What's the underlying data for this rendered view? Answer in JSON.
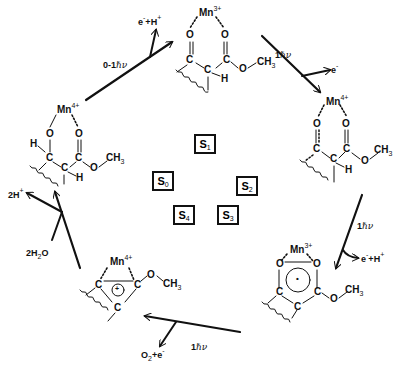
{
  "diagram": {
    "type": "cycle",
    "center_states": [
      {
        "id": "S1",
        "letter": "S",
        "index": "1"
      },
      {
        "id": "S0",
        "letter": "S",
        "index": "0"
      },
      {
        "id": "S2",
        "letter": "S",
        "index": "2"
      },
      {
        "id": "S4",
        "letter": "S",
        "index": "4"
      },
      {
        "id": "S3",
        "letter": "S",
        "index": "3"
      }
    ],
    "structures": {
      "top": {
        "mn": "Mn",
        "charge": "3+",
        "atoms": [
          "O",
          "O",
          "C",
          "C",
          "C",
          "H",
          "O",
          "CH",
          "3"
        ]
      },
      "right": {
        "mn": "Mn",
        "charge": "4+",
        "atoms": [
          "O",
          "O",
          "C",
          "C",
          "C",
          "H",
          "O",
          "CH",
          "3"
        ]
      },
      "bottom_right": {
        "mn": "Mn",
        "charge": "3+",
        "atoms": [
          "O",
          "O",
          "C",
          "C",
          "C",
          "O",
          "CH",
          "3"
        ],
        "ring_mark": "•"
      },
      "bottom_left": {
        "mn": "Mn",
        "charge": "4+",
        "atoms": [
          "C",
          "C",
          "C",
          "O",
          "CH",
          "3"
        ],
        "ring_mark": "+"
      },
      "left": {
        "mn": "Mn",
        "charge": "4+",
        "atoms": [
          "O",
          "O",
          "H",
          "C",
          "C",
          "C",
          "H",
          "O",
          "CH",
          "3"
        ]
      }
    },
    "transitions": [
      {
        "from": "S0",
        "to": "S1",
        "photons": "0-1",
        "hv": "ℏν",
        "released": "e",
        "released_sup": "-",
        "plus": "+",
        "proton": "H",
        "proton_sup": "+"
      },
      {
        "from": "S1",
        "to": "S2",
        "photons": "1",
        "hv": "ℏν",
        "released": "e",
        "released_sup": "-"
      },
      {
        "from": "S2",
        "to": "S3",
        "photons": "1",
        "hv": "ℏν",
        "released": "e",
        "released_sup": "-",
        "plus": "+",
        "proton": "H",
        "proton_sup": "+"
      },
      {
        "from": "S3",
        "to": "S4",
        "photons": "1",
        "hv": "ℏν",
        "released": "O",
        "released_sub": "2",
        "plus": "+",
        "electron": "e",
        "electron_sup": "-"
      },
      {
        "from": "S4",
        "to": "S0",
        "input": "2H",
        "input_sub": "2",
        "input_tail": "O",
        "released": "2H",
        "released_sup": "+"
      }
    ]
  }
}
